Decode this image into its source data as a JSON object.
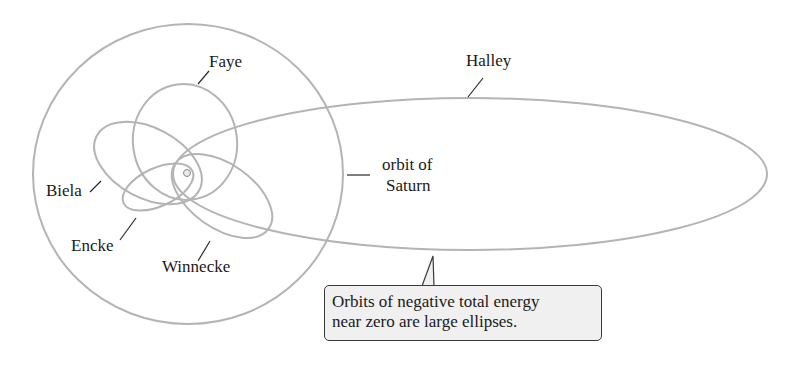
{
  "diagram": {
    "labels": {
      "faye": "Faye",
      "halley": "Halley",
      "biela": "Biela",
      "encke": "Encke",
      "winnecke": "Winnecke",
      "saturn_line1": "orbit of",
      "saturn_line2": "Saturn"
    },
    "callout": {
      "line1": "Orbits of negative total energy",
      "line2": "near zero are large ellipses."
    },
    "colors": {
      "orbit": "#b4b4b4",
      "text": "#1a1a1a",
      "callout_bg": "#f0f0f0",
      "callout_border": "#3a3a3a"
    }
  }
}
